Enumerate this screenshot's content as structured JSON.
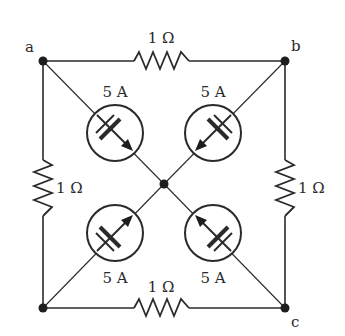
{
  "diagram": {
    "type": "circuit",
    "nodes": {
      "a": {
        "label": "a"
      },
      "b": {
        "label": "b"
      },
      "c": {
        "label": "c"
      }
    },
    "resistors": [
      {
        "id": "top",
        "label": "1 Ω",
        "between": "a-b"
      },
      {
        "id": "left",
        "label": "1 Ω",
        "between": "a-bottom-left"
      },
      {
        "id": "right",
        "label": "1 Ω",
        "between": "b-c"
      },
      {
        "id": "bottom",
        "label": "1 Ω",
        "between": "bottom-left-c"
      }
    ],
    "current_sources": [
      {
        "id": "top-left",
        "label": "5 A",
        "direction": "toward-center",
        "branch": "a-center"
      },
      {
        "id": "top-right",
        "label": "5 A",
        "direction": "toward-center",
        "branch": "b-center"
      },
      {
        "id": "bottom-left",
        "label": "5 A",
        "direction": "toward-center",
        "branch": "bottom-left-center"
      },
      {
        "id": "bottom-right",
        "label": "5 A",
        "direction": "toward-center",
        "branch": "c-center"
      }
    ],
    "colors": {
      "ink": "#2a2a2a",
      "background": "#ffffff"
    }
  }
}
